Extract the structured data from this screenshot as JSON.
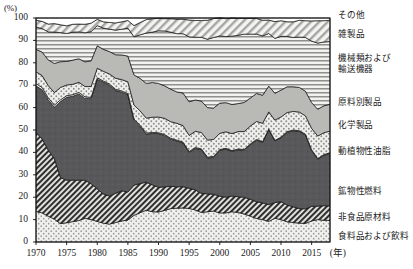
{
  "axis": {
    "unit_label": "(%)",
    "x_unit_label": "(年)",
    "y_ticks": [
      "0",
      "10",
      "20",
      "30",
      "40",
      "50",
      "60",
      "70",
      "80",
      "90",
      "100"
    ],
    "x_ticks": [
      "1970",
      "1975",
      "1980",
      "1985",
      "1990",
      "1995",
      "2000",
      "2005",
      "2010",
      "2015"
    ]
  },
  "legend": {
    "items": [
      {
        "label": "その他",
        "key": "other"
      },
      {
        "label": "雑製品",
        "key": "misc_manufactures"
      },
      {
        "label": "機械類および\n輸送機器",
        "key": "machinery_transport"
      },
      {
        "label": "原料別製品",
        "key": "manufactured_by_material"
      },
      {
        "label": "化学製品",
        "key": "chemicals"
      },
      {
        "label": "動植物性油脂",
        "key": "animal_vegetable_oils"
      },
      {
        "label": "鉱物性燃料",
        "key": "mineral_fuels"
      },
      {
        "label": "非食品原材料",
        "key": "crude_materials"
      },
      {
        "label": "食料品および飲料",
        "key": "food_beverages"
      }
    ]
  },
  "chart_data": {
    "type": "area",
    "title": "",
    "xlabel": "年",
    "ylabel": "%",
    "xlim": [
      1970,
      2018
    ],
    "ylim": [
      0,
      100
    ],
    "grid": false,
    "legend_position": "right",
    "stack_order_bottom_to_top": [
      "food_beverages",
      "crude_materials",
      "mineral_fuels",
      "animal_vegetable_oils",
      "chemicals",
      "manufactured_by_material",
      "machinery_transport",
      "misc_manufactures",
      "other"
    ],
    "x": [
      1970,
      1971,
      1972,
      1973,
      1974,
      1975,
      1976,
      1977,
      1978,
      1979,
      1980,
      1981,
      1982,
      1983,
      1984,
      1985,
      1986,
      1987,
      1988,
      1989,
      1990,
      1991,
      1992,
      1993,
      1994,
      1995,
      1996,
      1997,
      1998,
      1999,
      2000,
      2001,
      2002,
      2003,
      2004,
      2005,
      2006,
      2007,
      2008,
      2009,
      2010,
      2011,
      2012,
      2013,
      2014,
      2015,
      2016,
      2017,
      2018
    ],
    "series": [
      {
        "name": "食料品および飲料",
        "key": "food_beverages",
        "values": [
          13.6,
          13.0,
          11.5,
          10.2,
          8.2,
          8.6,
          9.1,
          9.6,
          10.6,
          10.0,
          9.2,
          8.4,
          8.0,
          8.7,
          9.4,
          9.8,
          11.9,
          13.1,
          14.2,
          13.5,
          13.4,
          14.1,
          14.9,
          15.1,
          15.2,
          15.0,
          14.3,
          13.2,
          13.5,
          13.8,
          13.0,
          13.0,
          13.5,
          13.2,
          12.5,
          11.5,
          10.5,
          10.0,
          9.2,
          10.6,
          10.0,
          9.0,
          8.7,
          8.4,
          8.3,
          9.4,
          10.0,
          9.7,
          9.6
        ]
      },
      {
        "name": "非食品原材料",
        "key": "crude_materials",
        "values": [
          35.4,
          33.0,
          29.5,
          27.0,
          20.5,
          19.0,
          18.5,
          18.0,
          17.0,
          16.0,
          14.5,
          13.0,
          12.5,
          13.0,
          13.5,
          12.5,
          13.5,
          13.0,
          12.5,
          12.0,
          11.0,
          10.5,
          10.0,
          9.5,
          9.5,
          9.0,
          9.0,
          8.5,
          8.0,
          7.5,
          7.5,
          7.0,
          7.0,
          7.0,
          7.5,
          7.5,
          7.5,
          7.5,
          7.5,
          7.0,
          8.0,
          7.5,
          7.0,
          6.5,
          6.5,
          6.5,
          6.0,
          6.5,
          6.5
        ]
      },
      {
        "name": "鉱物性燃料",
        "key": "mineral_fuels",
        "values": [
          20.7,
          22.0,
          22.5,
          23.0,
          34.0,
          37.0,
          37.5,
          38.5,
          36.5,
          38.0,
          49.0,
          50.0,
          49.5,
          46.0,
          44.0,
          43.5,
          29.0,
          25.5,
          21.5,
          23.0,
          24.0,
          23.0,
          21.0,
          20.5,
          19.5,
          16.0,
          18.5,
          19.5,
          16.0,
          16.5,
          20.5,
          21.5,
          20.0,
          21.0,
          21.0,
          24.5,
          27.5,
          27.0,
          33.5,
          27.5,
          28.5,
          32.5,
          34.0,
          34.5,
          33.0,
          25.0,
          21.0,
          22.5,
          23.5
        ]
      },
      {
        "name": "動植物性油脂",
        "key": "animal_vegetable_oils",
        "values": [
          1.0,
          1.0,
          0.9,
          0.9,
          0.8,
          0.7,
          0.7,
          0.7,
          0.7,
          0.6,
          0.6,
          0.5,
          0.5,
          0.5,
          0.5,
          0.5,
          0.5,
          0.5,
          0.5,
          0.4,
          0.4,
          0.4,
          0.4,
          0.4,
          0.4,
          0.4,
          0.4,
          0.4,
          0.4,
          0.4,
          0.3,
          0.3,
          0.3,
          0.3,
          0.3,
          0.3,
          0.3,
          0.3,
          0.3,
          0.3,
          0.3,
          0.3,
          0.3,
          0.3,
          0.3,
          0.3,
          0.3,
          0.3,
          0.3
        ]
      },
      {
        "name": "化学製品",
        "key": "chemicals",
        "values": [
          5.3,
          5.3,
          5.4,
          5.6,
          5.5,
          4.8,
          4.6,
          4.5,
          4.6,
          4.8,
          4.3,
          4.3,
          4.5,
          4.9,
          5.1,
          5.2,
          6.2,
          6.4,
          6.6,
          6.8,
          7.0,
          7.2,
          7.4,
          7.5,
          7.4,
          7.2,
          7.2,
          7.3,
          7.6,
          7.6,
          7.2,
          7.4,
          7.6,
          7.8,
          8.0,
          8.0,
          8.0,
          8.2,
          7.6,
          9.0,
          9.0,
          8.5,
          8.3,
          8.3,
          8.2,
          9.5,
          10.0,
          9.8,
          9.6
        ]
      },
      {
        "name": "原料別製品",
        "key": "manufactured_by_material",
        "values": [
          10.0,
          10.5,
          11.5,
          13.0,
          11.5,
          10.5,
          10.8,
          10.5,
          11.0,
          11.5,
          10.0,
          9.8,
          10.0,
          10.5,
          11.0,
          11.5,
          13.5,
          14.5,
          15.5,
          15.5,
          15.0,
          14.5,
          14.5,
          14.0,
          14.5,
          15.0,
          14.0,
          14.0,
          14.5,
          14.0,
          13.5,
          13.0,
          13.0,
          12.5,
          13.0,
          12.5,
          12.5,
          12.5,
          11.5,
          12.0,
          12.0,
          11.5,
          11.0,
          11.0,
          11.0,
          11.5,
          12.0,
          12.0,
          12.0
        ]
      },
      {
        "name": "機械類および輸送機器",
        "key": "machinery_transport",
        "values": [
          10.0,
          10.5,
          12.5,
          14.0,
          13.0,
          12.5,
          12.5,
          12.0,
          13.0,
          13.0,
          9.0,
          9.5,
          10.0,
          11.0,
          11.5,
          12.5,
          17.0,
          19.5,
          22.5,
          22.5,
          23.5,
          24.5,
          25.5,
          26.0,
          26.5,
          29.0,
          28.0,
          28.5,
          30.5,
          31.5,
          30.0,
          29.5,
          30.5,
          30.5,
          30.5,
          28.5,
          26.5,
          26.5,
          23.5,
          24.5,
          24.0,
          22.5,
          22.0,
          22.5,
          24.0,
          27.5,
          29.5,
          28.5,
          28.0
        ]
      },
      {
        "name": "雑製品",
        "key": "misc_manufactures",
        "values": [
          3.0,
          3.2,
          3.5,
          3.8,
          3.5,
          3.4,
          3.5,
          3.5,
          3.8,
          3.8,
          2.8,
          2.8,
          3.0,
          3.2,
          3.3,
          3.4,
          5.0,
          5.5,
          6.0,
          6.0,
          5.5,
          5.5,
          6.0,
          6.5,
          6.5,
          7.5,
          7.5,
          7.5,
          8.5,
          8.5,
          8.0,
          8.0,
          8.0,
          7.5,
          7.0,
          7.0,
          7.0,
          7.0,
          6.0,
          7.5,
          7.0,
          6.5,
          7.0,
          7.5,
          7.5,
          9.0,
          10.0,
          9.5,
          9.5
        ]
      },
      {
        "name": "その他",
        "key": "other",
        "values": [
          1.0,
          1.5,
          2.7,
          2.5,
          3.0,
          3.5,
          2.8,
          2.7,
          2.8,
          2.3,
          0.6,
          1.7,
          2.0,
          2.2,
          1.7,
          1.1,
          3.4,
          2.0,
          0.7,
          0.3,
          0.2,
          0.3,
          0.3,
          0.5,
          0.5,
          0.9,
          1.1,
          1.1,
          1.0,
          0.2,
          0.0,
          0.3,
          0.1,
          0.2,
          0.2,
          0.2,
          0.2,
          1.0,
          0.9,
          1.6,
          1.2,
          1.7,
          1.7,
          1.0,
          1.2,
          1.3,
          1.2,
          1.2,
          1.0
        ]
      }
    ]
  }
}
